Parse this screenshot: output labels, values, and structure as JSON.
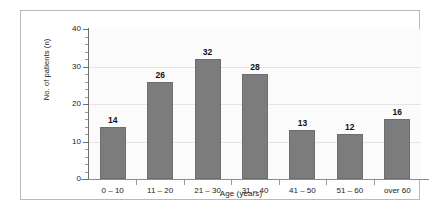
{
  "chart_data": {
    "type": "bar",
    "title": "",
    "xlabel": "Age (years)",
    "ylabel": "No. of patients (n)",
    "categories": [
      "0 – 10",
      "11 – 20",
      "21 – 30",
      "31 – 40",
      "41 – 50",
      "51 – 60",
      "over 60"
    ],
    "values": [
      14,
      26,
      32,
      28,
      13,
      12,
      16
    ],
    "value_labels": [
      "14",
      "26",
      "32",
      "28",
      "13",
      "12",
      "16"
    ],
    "ylim": [
      0,
      40
    ],
    "ytick_labels": [
      "0",
      "10",
      "20",
      "30",
      "40"
    ],
    "ytick_values": [
      0,
      10,
      20,
      30,
      40
    ],
    "yminor_step": 2,
    "grid": "horizontal",
    "legend": "none",
    "bar_color": "#7c7c7c",
    "plot_background": "#fbfbfb",
    "frame_color": "#b9b9b9",
    "gridline_color": "#e4e4e4"
  }
}
